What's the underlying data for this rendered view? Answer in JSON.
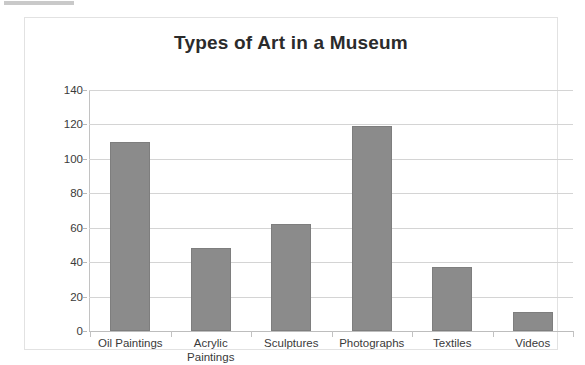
{
  "chart_data": {
    "type": "bar",
    "title": "Types of Art in a Museum",
    "xlabel": "",
    "ylabel": "",
    "categories": [
      "Oil Paintings",
      "Acrylic Paintings",
      "Sculptures",
      "Photographs",
      "Textiles",
      "Videos"
    ],
    "category_lines": [
      [
        "Oil Paintings"
      ],
      [
        "Acrylic",
        "Paintings"
      ],
      [
        "Sculptures"
      ],
      [
        "Photographs"
      ],
      [
        "Textiles"
      ],
      [
        "Videos"
      ]
    ],
    "values": [
      110,
      48,
      62,
      119,
      37,
      11
    ],
    "ylim": [
      0,
      140
    ],
    "ytick_step": 20,
    "yticks": [
      0,
      20,
      40,
      60,
      80,
      100,
      120,
      140
    ],
    "ytick_labels": [
      "0",
      "20",
      "40",
      "60",
      "80",
      "100",
      "120",
      "140"
    ],
    "grid": true,
    "legend": false,
    "legend_position": "none",
    "bar_color": "#8b8b8b",
    "gridline_color": "#d4d4d4",
    "axis_color": "#c2c2c2",
    "title_color": "#2b2b2b",
    "plot_background": "#ffffff"
  }
}
